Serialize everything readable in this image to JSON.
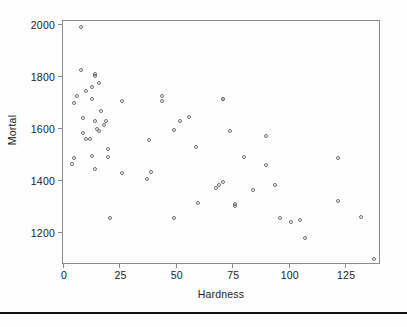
{
  "chart_data": {
    "type": "scatter",
    "title": "",
    "xlabel": "Hardness",
    "ylabel": "Mortal",
    "xlim": [
      0,
      140
    ],
    "ylim": [
      1080,
      2010
    ],
    "grid": false,
    "legend": null,
    "xticks": [
      0,
      25,
      50,
      75,
      100,
      125
    ],
    "xtick_labels": [
      "0",
      "25",
      "50",
      "75",
      "100",
      "125"
    ],
    "yticks": [
      1200,
      1400,
      1600,
      1800,
      2000
    ],
    "ytick_labels": [
      "1200",
      "1400",
      "1600",
      "1800",
      "2000"
    ],
    "marker": "open-circle",
    "marker_color": "#6e6e6e",
    "n_points": 61,
    "points": [
      {
        "x": 8,
        "y": 1987
      },
      {
        "x": 8,
        "y": 1823
      },
      {
        "x": 14,
        "y": 1807
      },
      {
        "x": 14,
        "y": 1800
      },
      {
        "x": 16,
        "y": 1772
      },
      {
        "x": 13,
        "y": 1755
      },
      {
        "x": 10,
        "y": 1742
      },
      {
        "x": 6,
        "y": 1723
      },
      {
        "x": 5,
        "y": 1696
      },
      {
        "x": 26,
        "y": 1704
      },
      {
        "x": 44,
        "y": 1723
      },
      {
        "x": 44,
        "y": 1704
      },
      {
        "x": 71,
        "y": 1712
      },
      {
        "x": 71,
        "y": 1709
      },
      {
        "x": 13,
        "y": 1712
      },
      {
        "x": 17,
        "y": 1666
      },
      {
        "x": 9,
        "y": 1637
      },
      {
        "x": 14,
        "y": 1625
      },
      {
        "x": 19,
        "y": 1625
      },
      {
        "x": 18,
        "y": 1609
      },
      {
        "x": 15,
        "y": 1596
      },
      {
        "x": 16,
        "y": 1587
      },
      {
        "x": 52,
        "y": 1627
      },
      {
        "x": 56,
        "y": 1641
      },
      {
        "x": 9,
        "y": 1578
      },
      {
        "x": 10,
        "y": 1558
      },
      {
        "x": 12,
        "y": 1557
      },
      {
        "x": 49,
        "y": 1591
      },
      {
        "x": 74,
        "y": 1589
      },
      {
        "x": 90,
        "y": 1569
      },
      {
        "x": 38,
        "y": 1554
      },
      {
        "x": 59,
        "y": 1527
      },
      {
        "x": 20,
        "y": 1519
      },
      {
        "x": 5,
        "y": 1485
      },
      {
        "x": 4,
        "y": 1462
      },
      {
        "x": 13,
        "y": 1491
      },
      {
        "x": 20,
        "y": 1487
      },
      {
        "x": 80,
        "y": 1486
      },
      {
        "x": 122,
        "y": 1485
      },
      {
        "x": 90,
        "y": 1456
      },
      {
        "x": 14,
        "y": 1443
      },
      {
        "x": 26,
        "y": 1427
      },
      {
        "x": 39,
        "y": 1428
      },
      {
        "x": 37,
        "y": 1402
      },
      {
        "x": 71,
        "y": 1392
      },
      {
        "x": 69,
        "y": 1378
      },
      {
        "x": 68,
        "y": 1369
      },
      {
        "x": 94,
        "y": 1378
      },
      {
        "x": 84,
        "y": 1359
      },
      {
        "x": 122,
        "y": 1318
      },
      {
        "x": 60,
        "y": 1309
      },
      {
        "x": 76,
        "y": 1307
      },
      {
        "x": 76,
        "y": 1299
      },
      {
        "x": 21,
        "y": 1254
      },
      {
        "x": 49,
        "y": 1254
      },
      {
        "x": 96,
        "y": 1254
      },
      {
        "x": 105,
        "y": 1247
      },
      {
        "x": 132,
        "y": 1257
      },
      {
        "x": 101,
        "y": 1236
      },
      {
        "x": 107,
        "y": 1175
      },
      {
        "x": 138,
        "y": 1096
      }
    ]
  }
}
